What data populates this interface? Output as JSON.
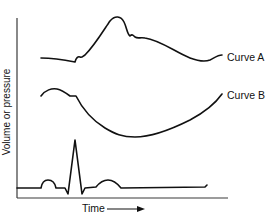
{
  "diagram": {
    "y_axis_label": "Volume or pressure",
    "x_axis_label": "Time",
    "x_axis_arrow": "arrow-right",
    "curves": [
      {
        "id": "A",
        "label": "Curve A",
        "description": "Pressure-like waveform: flat, small notch, sharp rise to peak, dicrotic notch, gradual decline"
      },
      {
        "id": "B",
        "label": "Curve B",
        "description": "Volume-like waveform: small hump, notch, descent to trough, gradual rise"
      },
      {
        "id": "ECG",
        "label": "",
        "description": "ECG trace with P wave, QRS complex, T wave"
      }
    ],
    "colors": {
      "background": "#ffffff",
      "line": "#111111",
      "axis": "#3a3a3a"
    }
  }
}
